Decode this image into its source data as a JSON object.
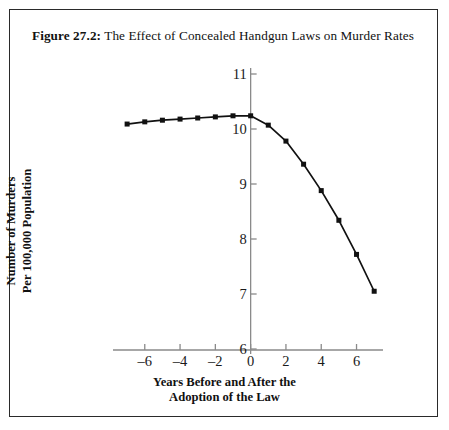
{
  "figure": {
    "label": "Figure 27.2:",
    "title": " The Effect of Concealed Handgun Laws on Murder Rates",
    "border_color": "#2a2a2a",
    "background_color": "#ffffff"
  },
  "chart_data": {
    "type": "line",
    "title": "Figure 27.2: The Effect of Concealed Handgun Laws on Murder Rates",
    "xlabel": "Years Before and After the Adoption of the Law",
    "ylabel": "Number of Murders Per 100,000 Population",
    "xlabel_lines": [
      "Years Before and After the",
      "Adoption of the Law"
    ],
    "ylabel_lines": [
      "Number of Murders",
      "Per 100,000 Population"
    ],
    "x": [
      -7,
      -6,
      -5,
      -4,
      -3,
      -2,
      -1,
      0,
      1,
      2,
      3,
      4,
      5,
      6,
      7
    ],
    "values": [
      10.09,
      10.13,
      10.16,
      10.18,
      10.2,
      10.22,
      10.24,
      10.24,
      10.07,
      9.78,
      9.36,
      8.88,
      8.34,
      7.72,
      7.05
    ],
    "xlim": [
      -7.8,
      7.5
    ],
    "ylim": [
      6,
      11
    ],
    "x_ticks": [
      -6,
      -4,
      -2,
      0,
      2,
      4,
      6
    ],
    "x_tick_labels": [
      "–6",
      "–4",
      "–2",
      "0",
      "2",
      "4",
      "6"
    ],
    "y_ticks": [
      6,
      7,
      8,
      9,
      10,
      11
    ],
    "y_tick_labels": [
      "6",
      "7",
      "8",
      "9",
      "10",
      "11"
    ],
    "grid": false,
    "legend": null,
    "series_name": "Murder rate per 100,000 population",
    "line_color": "#111111",
    "marker_color": "#111111",
    "marker_shape": "square",
    "axis_color": "#8a8a8a"
  }
}
